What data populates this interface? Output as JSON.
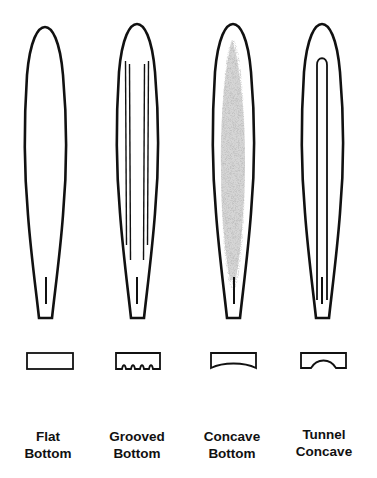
{
  "diagram": {
    "type": "surfboard-bottom-shapes",
    "colors": {
      "outline": "#111111",
      "shading": "#9a9a9a",
      "background": "#ffffff"
    },
    "boards": [
      {
        "id": "flat-bottom",
        "label_line1": "Flat",
        "label_line2": "Bottom",
        "feature": "none",
        "cross_section": "flat rectangle"
      },
      {
        "id": "grooved-bottom",
        "label_line1": "Grooved",
        "label_line2": "Bottom",
        "feature": "parallel grooves",
        "cross_section": "rectangle with grooves"
      },
      {
        "id": "concave-bottom",
        "label_line1": "Concave",
        "label_line2": "Bottom",
        "feature": "shaded concave",
        "cross_section": "rectangle with curved bottom"
      },
      {
        "id": "tunnel-concave",
        "label_line1": "Tunnel",
        "label_line2": "Concave",
        "feature": "tunnel channel",
        "cross_section": "rectangle with arched tunnel"
      }
    ]
  }
}
